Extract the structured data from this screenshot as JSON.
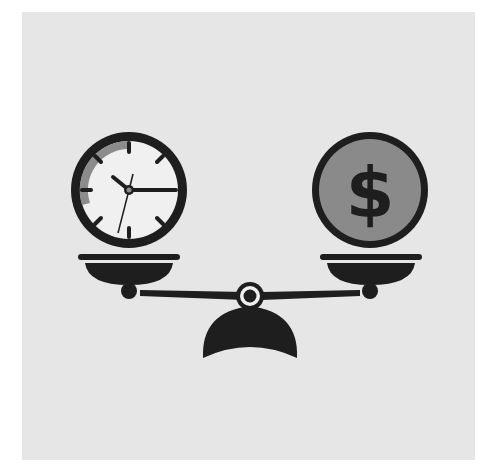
{
  "illustration": {
    "subject": "balance scale weighing time against money",
    "left_pan_item": "clock",
    "right_pan_item": "dollar coin",
    "coin_symbol": "$",
    "clock_time": "10:15"
  },
  "colors": {
    "page_background": "#ffffff",
    "panel_background": "#e6e6e6",
    "ink": "#1e1e1e",
    "clock_face": "#f0f0f0",
    "clock_shadow": "#8c8c8c",
    "coin_fill": "#8a8a8a"
  }
}
